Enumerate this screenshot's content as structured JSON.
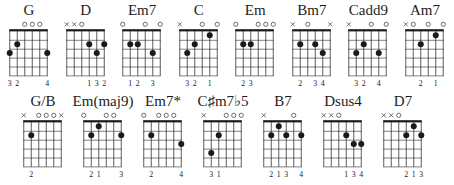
{
  "colors": {
    "background": "#ffffff",
    "ink": "#1a1a1a",
    "marker": "#5a5a5a"
  },
  "diagram_spec": {
    "strings": 6,
    "frets_shown": 5,
    "open_marker_symbol": "o",
    "muted_marker_symbol": "x"
  },
  "rows": [
    {
      "chords": [
        {
          "label": "G",
          "markers": [
            "",
            "",
            "o",
            "o",
            "o",
            ""
          ],
          "dots": [
            [
              1,
              3
            ],
            [
              2,
              2
            ],
            [
              6,
              3
            ]
          ],
          "fingers": [
            "3",
            "2",
            "",
            "",
            "",
            "4"
          ]
        },
        {
          "label": "D",
          "markers": [
            "x",
            "x",
            "o",
            "",
            "",
            ""
          ],
          "dots": [
            [
              4,
              2
            ],
            [
              5,
              3
            ],
            [
              6,
              2
            ]
          ],
          "fingers": [
            "",
            "",
            "",
            "1",
            "3",
            "2"
          ]
        },
        {
          "label": "Em7",
          "markers": [
            "o",
            "",
            "",
            "o",
            "",
            "o"
          ],
          "dots": [
            [
              2,
              2
            ],
            [
              3,
              2
            ],
            [
              5,
              3
            ]
          ],
          "fingers": [
            "",
            "1",
            "2",
            "",
            "3",
            ""
          ]
        },
        {
          "label": "C",
          "markers": [
            "x",
            "",
            "",
            "o",
            "",
            "o"
          ],
          "dots": [
            [
              2,
              3
            ],
            [
              3,
              2
            ],
            [
              5,
              1
            ]
          ],
          "fingers": [
            "",
            "3",
            "2",
            "",
            "1",
            ""
          ]
        },
        {
          "label": "Em",
          "markers": [
            "o",
            "",
            "",
            "o",
            "o",
            "o"
          ],
          "dots": [
            [
              2,
              2
            ],
            [
              3,
              2
            ]
          ],
          "fingers": [
            "",
            "2",
            "3",
            "",
            "",
            ""
          ]
        },
        {
          "label": "Bm7",
          "markers": [
            "x",
            "",
            "o",
            "",
            "",
            "x"
          ],
          "dots": [
            [
              2,
              2
            ],
            [
              4,
              2
            ],
            [
              5,
              3
            ]
          ],
          "fingers": [
            "",
            "2",
            "",
            "3",
            "4",
            ""
          ]
        },
        {
          "label": "Cadd9",
          "markers": [
            "x",
            "",
            "",
            "o",
            "",
            "o"
          ],
          "dots": [
            [
              2,
              3
            ],
            [
              3,
              2
            ],
            [
              5,
              3
            ]
          ],
          "fingers": [
            "",
            "3",
            "2",
            "",
            "4",
            ""
          ]
        },
        {
          "label": "Am7",
          "markers": [
            "x",
            "o",
            "",
            "o",
            "",
            "o"
          ],
          "dots": [
            [
              3,
              2
            ],
            [
              5,
              1
            ]
          ],
          "fingers": [
            "",
            "",
            "2",
            "",
            "1",
            ""
          ]
        }
      ]
    },
    {
      "chords": [
        {
          "label": "G/B",
          "markers": [
            "x",
            "",
            "o",
            "o",
            "o",
            "x"
          ],
          "dots": [
            [
              2,
              2
            ]
          ],
          "fingers": [
            "",
            "2",
            "",
            "",
            "",
            ""
          ]
        },
        {
          "label": "Em(maj9)",
          "markers": [
            "o",
            "",
            "",
            "o",
            "o",
            ""
          ],
          "dots": [
            [
              2,
              2
            ],
            [
              3,
              1
            ],
            [
              6,
              2
            ]
          ],
          "fingers": [
            "",
            "2",
            "1",
            "",
            "",
            "3"
          ]
        },
        {
          "label": "Em7*",
          "markers": [
            "o",
            "",
            "o",
            "o",
            "o",
            ""
          ],
          "dots": [
            [
              2,
              2
            ],
            [
              6,
              3
            ]
          ],
          "fingers": [
            "",
            "2",
            "",
            "",
            "",
            "4"
          ]
        },
        {
          "label": "C♯m7♭5",
          "markers": [
            "x",
            "",
            "",
            "o",
            "o",
            "o"
          ],
          "dots": [
            [
              2,
              4
            ],
            [
              3,
              2
            ]
          ],
          "fingers": [
            "",
            "3",
            "1",
            "",
            "",
            ""
          ]
        },
        {
          "label": "B7",
          "markers": [
            "x",
            "",
            "",
            "",
            "o",
            ""
          ],
          "dots": [
            [
              2,
              2
            ],
            [
              3,
              1
            ],
            [
              4,
              2
            ],
            [
              6,
              2
            ]
          ],
          "fingers": [
            "",
            "2",
            "1",
            "3",
            "",
            "4"
          ]
        },
        {
          "label": "Dsus4",
          "markers": [
            "x",
            "x",
            "o",
            "",
            "",
            ""
          ],
          "dots": [
            [
              4,
              2
            ],
            [
              5,
              3
            ],
            [
              6,
              3
            ]
          ],
          "fingers": [
            "",
            "",
            "",
            "1",
            "3",
            "4"
          ]
        },
        {
          "label": "D7",
          "markers": [
            "x",
            "x",
            "o",
            "",
            "",
            ""
          ],
          "dots": [
            [
              4,
              2
            ],
            [
              5,
              1
            ],
            [
              6,
              2
            ]
          ],
          "fingers": [
            "",
            "",
            "",
            "2",
            "1",
            "3"
          ]
        }
      ]
    }
  ]
}
